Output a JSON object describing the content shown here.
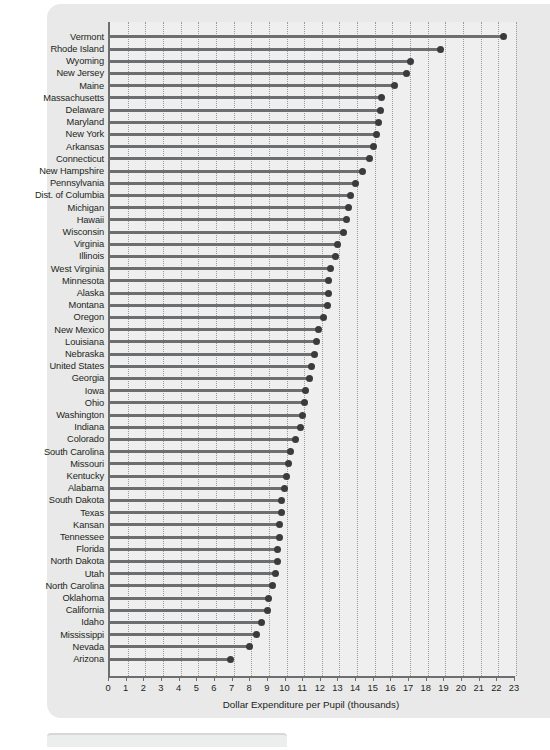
{
  "chart_data": {
    "type": "bar",
    "subtype": "lollipop-horizontal",
    "title": "",
    "subtitle": "",
    "xlabel": "Dollar Expenditure per Pupil (thousands)",
    "ylabel": "",
    "xlim": [
      0,
      23
    ],
    "xticks": [
      0,
      1,
      2,
      3,
      4,
      5,
      6,
      7,
      8,
      9,
      10,
      11,
      12,
      13,
      14,
      15,
      16,
      17,
      18,
      19,
      20,
      21,
      22,
      23
    ],
    "xticklabels": [
      "0",
      "1",
      "2",
      "3",
      "4",
      "5",
      "6",
      "7",
      "8",
      "9",
      "10",
      "11",
      "12",
      "13",
      "14",
      "15",
      "16",
      "17",
      "18",
      "19",
      "20",
      "21",
      "22",
      "23"
    ],
    "grid": "vertical-dotted",
    "legend": null,
    "orientation": "horizontal",
    "sorted": "descending",
    "categories": [
      "Vermont",
      "Rhode Island",
      "Wyoming",
      "New Jersey",
      "Maine",
      "Massachusetts",
      "Delaware",
      "Maryland",
      "New York",
      "Arkansas",
      "Connecticut",
      "New Hampshire",
      "Pennsylvania",
      "Dist. of Columbia",
      "Michigan",
      "Hawaii",
      "Wisconsin",
      "Virginia",
      "Illinois",
      "West Virginia",
      "Minnesota",
      "Alaska",
      "Montana",
      "Oregon",
      "New Mexico",
      "Louisiana",
      "Nebraska",
      "United States",
      "Georgia",
      "Iowa",
      "Ohio",
      "Washington",
      "Indiana",
      "Colorado",
      "South Carolina",
      "Missouri",
      "Kentucky",
      "Alabama",
      "South Dakota",
      "Texas",
      "Kansan",
      "Tennessee",
      "Florida",
      "North Dakota",
      "Utah",
      "North Carolina",
      "Oklahoma",
      "California",
      "Idaho",
      "Mississippi",
      "Nevada",
      "Arizona"
    ],
    "values": [
      22.3,
      18.7,
      17.0,
      16.8,
      16.1,
      15.4,
      15.3,
      15.2,
      15.1,
      14.9,
      14.7,
      14.3,
      13.9,
      13.6,
      13.5,
      13.4,
      13.2,
      12.9,
      12.8,
      12.5,
      12.4,
      12.4,
      12.3,
      12.1,
      11.8,
      11.7,
      11.6,
      11.4,
      11.3,
      11.1,
      11.0,
      10.9,
      10.8,
      10.5,
      10.2,
      10.1,
      10.0,
      9.9,
      9.7,
      9.7,
      9.6,
      9.6,
      9.5,
      9.5,
      9.4,
      9.2,
      9.0,
      8.9,
      8.6,
      8.3,
      7.9,
      6.8
    ]
  },
  "axis": {
    "x_title": "Dollar Expenditure per Pupil (thousands)"
  },
  "style": {
    "panel_bg": "#e9e9e9",
    "plot_bg": "#efefef",
    "stem_color": "#6d6e70",
    "dot_color": "#3b3b3d",
    "grid_color": "#9b9c9e",
    "text_color": "#231f20"
  }
}
